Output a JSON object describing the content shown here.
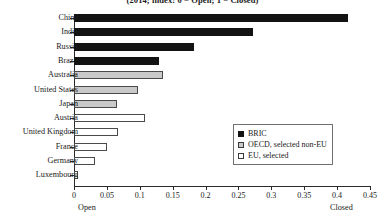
{
  "chart_data": {
    "type": "bar",
    "orientation": "horizontal",
    "title": "(2014; index: 0 = Open; 1 = Closed)",
    "xlabel": "",
    "ylabel": "",
    "xlim": [
      0,
      0.45
    ],
    "grid": false,
    "categories": [
      "China",
      "India",
      "Russia",
      "Brazil",
      "Australia",
      "United States",
      "Japan",
      "Austria",
      "United Kingdom",
      "France",
      "Germany",
      "Luxembourg"
    ],
    "values": [
      0.416,
      0.272,
      0.182,
      0.129,
      0.135,
      0.098,
      0.065,
      0.108,
      0.067,
      0.05,
      0.032,
      0.006
    ],
    "groups": [
      "BRIC",
      "BRIC",
      "BRIC",
      "BRIC",
      "OECD",
      "OECD",
      "OECD",
      "EU",
      "EU",
      "EU",
      "EU",
      "EU"
    ],
    "tick_labels": [
      "0",
      "0.05",
      "0.1",
      "0.15",
      "0.2",
      "0.25",
      "0.3",
      "0.35",
      "0.4",
      "0.45"
    ],
    "tick_values": [
      0,
      0.05,
      0.1,
      0.15,
      0.2,
      0.25,
      0.3,
      0.35,
      0.4,
      0.45
    ],
    "axis_endpoint_labels": {
      "left": "Open",
      "right": "Closed"
    },
    "legend": {
      "position": "center-right",
      "entries": [
        {
          "label": "BRIC",
          "color": "#131313",
          "key": "bric"
        },
        {
          "label": "OECD, selected non-EU",
          "color": "#c9c9c9",
          "key": "oecd"
        },
        {
          "label": "EU, selected",
          "color": "#ffffff",
          "key": "eu"
        }
      ]
    },
    "colors": {
      "bric": "#131313",
      "oecd": "#c9c9c9",
      "eu": "#ffffff",
      "outline": "#4a4a4a",
      "axis": "#2a2a2a"
    }
  }
}
